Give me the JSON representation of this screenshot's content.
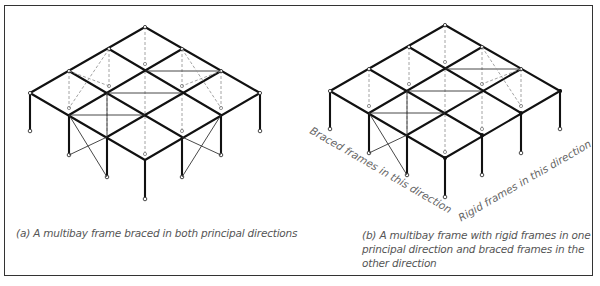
{
  "figure": {
    "panels": [
      {
        "id": "a",
        "caption": "(a) A multibay frame braced in both principal directions"
      },
      {
        "id": "b",
        "caption": "(b) A multibay frame with rigid frames in one principal direction and braced frames in the other direction",
        "direction_labels": {
          "braced": "Braced frames in this direction",
          "rigid": "Rigid frames in this direction"
        }
      }
    ],
    "colors": {
      "beam": "#111111",
      "brace": "#444444",
      "hidden": "#999999",
      "caption": "#555555",
      "border": "#333333"
    }
  }
}
